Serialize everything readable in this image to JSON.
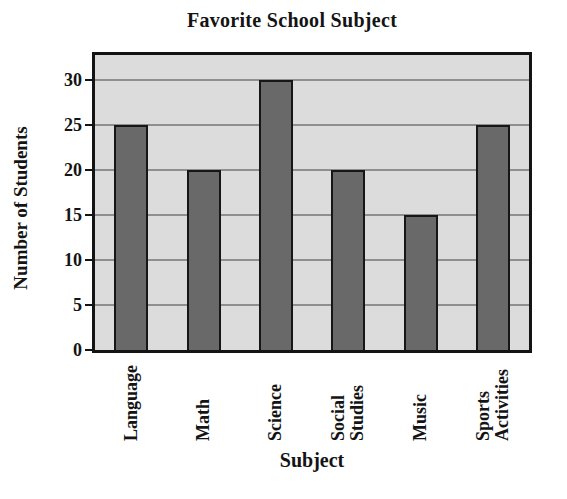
{
  "chart_data": {
    "type": "bar",
    "title": "Favorite School Subject",
    "xlabel": "Subject",
    "ylabel": "Number of Students",
    "categories": [
      "Language",
      "Math",
      "Science",
      "Social Studies",
      "Music",
      "Sports Activities"
    ],
    "values": [
      25,
      20,
      30,
      20,
      15,
      25
    ],
    "yticks": [
      0,
      5,
      10,
      15,
      20,
      25,
      30
    ],
    "ylim": [
      0,
      32.8
    ],
    "grid": true,
    "legend": false,
    "colors": {
      "bar_fill": "#696969",
      "bar_border": "#161616",
      "plot_background": "#dcdcdc",
      "gridline": "#8f8f8f",
      "frame": "#141414",
      "text": "#141414",
      "page_background": "#ffffff"
    }
  }
}
